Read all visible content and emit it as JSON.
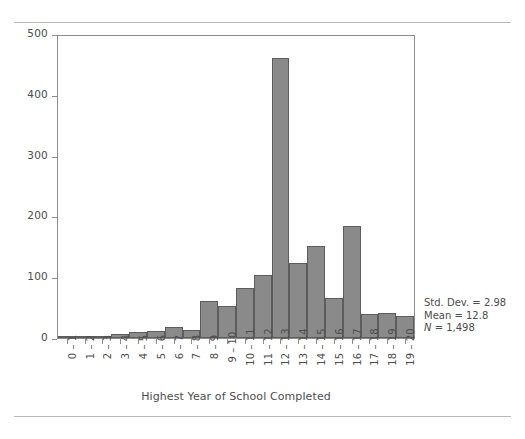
{
  "figure": {
    "x_axis_title": "Highest Year of School Completed",
    "stats": {
      "std_dev_label": "Std. Dev. = 2.98",
      "mean_label": "Mean = 12.8",
      "n_prefix": "N",
      "n_value": " = 1,498"
    },
    "colors": {
      "bar_fill": "#8a8a8a",
      "bar_stroke": "#5d5d5d",
      "axis": "#8d8d8d",
      "text": "#4d4d4d",
      "rule": "#b9b9b9"
    }
  },
  "chart_data": {
    "type": "bar",
    "title": "",
    "subtitle": "",
    "xlabel": "Highest Year of School Completed",
    "ylabel": "",
    "categories": [
      "0 – 1",
      "1 – 2",
      "2 – 3",
      "3 – 4",
      "4 – 5",
      "5 – 6",
      "6 – 7",
      "7 – 8",
      "8 – 9",
      "9 – 10",
      "10 – 11",
      "11 – 12",
      "12 – 13",
      "13 – 14",
      "14 – 15",
      "15 – 16",
      "16 – 17",
      "17 – 18",
      "18 – 19",
      "19 – 20"
    ],
    "values": [
      2,
      1,
      1,
      6,
      10,
      12,
      19,
      14,
      61,
      53,
      82,
      104,
      463,
      124,
      152,
      66,
      186,
      39,
      42,
      36
    ],
    "ylim": [
      0,
      500
    ],
    "yticks": [
      0,
      100,
      200,
      300,
      400,
      500
    ],
    "ytick_labels": [
      "0",
      "100",
      "200",
      "300",
      "400",
      "500"
    ],
    "grid": false,
    "legend": "none",
    "annotations": [
      "Std. Dev. = 2.98",
      "Mean = 12.8",
      "N = 1,498"
    ]
  }
}
